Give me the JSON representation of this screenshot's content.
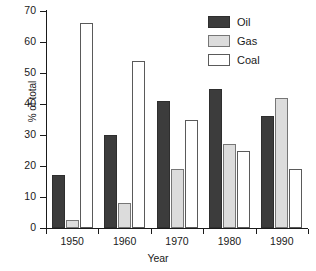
{
  "chart_data": {
    "type": "bar",
    "title": "",
    "xlabel": "Year",
    "ylabel": "% of total",
    "categories": [
      "1950",
      "1960",
      "1970",
      "1980",
      "1990"
    ],
    "series": [
      {
        "name": "Oil",
        "color": "#3c3c3c",
        "values": [
          17,
          30,
          41,
          45,
          36
        ]
      },
      {
        "name": "Gas",
        "color": "#dcdcdc",
        "values": [
          2.5,
          8,
          19,
          27,
          42
        ]
      },
      {
        "name": "Coal",
        "color": "#ffffff",
        "values": [
          66,
          54,
          35,
          25,
          19
        ]
      }
    ],
    "ylim": [
      0,
      70
    ],
    "yticks": [
      0,
      10,
      20,
      30,
      40,
      50,
      60,
      70
    ],
    "ytick_labels": [
      "0",
      "10",
      "20",
      "30",
      "40",
      "50",
      "60",
      "70"
    ],
    "grid": false,
    "legend_position": "top-right",
    "legend_entries": [
      "Oil",
      "Gas",
      "Coal"
    ]
  }
}
